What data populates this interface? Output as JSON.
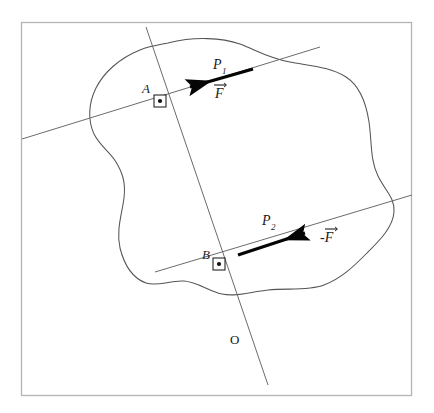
{
  "figure": {
    "domain": "diagram",
    "width": 434,
    "height": 413,
    "background_color": "#ffffff",
    "frame": {
      "name": "figure-border",
      "x": 21,
      "y": 22,
      "width": 391,
      "height": 374,
      "stroke_color": "#b4b4b4",
      "stroke_width": 1.2
    }
  },
  "colors": {
    "outline": "#555555",
    "line": "#6b6b6b",
    "arrow": "#050505",
    "text": "#1a1a1a",
    "frame": "#b4b4b4",
    "marker_fill": "#ffffff",
    "marker_stroke": "#111111"
  },
  "labels": {
    "p1": "P",
    "p1_sub": "1",
    "p2": "P",
    "p2_sub": "2",
    "force_positive": "F",
    "force_negative": "-F",
    "point_a": "A",
    "point_b": "B",
    "origin": "O"
  },
  "geometry": {
    "body_outline_name": "rigid-body-outline",
    "line_p1": {
      "x1": 22,
      "y1": 139,
      "x2": 320,
      "y2": 47
    },
    "line_p2": {
      "x1": 155,
      "y1": 272,
      "x2": 412,
      "y2": 195
    },
    "line_oblique": {
      "x1": 146,
      "y1": 27,
      "x2": 268,
      "y2": 385
    },
    "arrow_f": {
      "tail_x": 253,
      "tail_y": 69,
      "tip_x": 183,
      "tip_y": 89
    },
    "arrow_neg_f": {
      "tail_x": 238,
      "tail_y": 255,
      "tip_x": 312,
      "tip_y": 231
    },
    "marker_a": {
      "cx": 160,
      "cy": 101,
      "size": 12
    },
    "marker_b": {
      "cx": 219,
      "cy": 264,
      "size": 12
    }
  },
  "label_positions": {
    "p1": {
      "x": 213,
      "y": 69
    },
    "force_positive": {
      "x": 215,
      "y": 96
    },
    "p2": {
      "x": 262,
      "y": 225
    },
    "force_negative": {
      "x": 322,
      "y": 240
    },
    "point_a": {
      "x": 142,
      "y": 93
    },
    "point_b": {
      "x": 203,
      "y": 259
    },
    "origin": {
      "x": 231,
      "y": 343
    }
  }
}
